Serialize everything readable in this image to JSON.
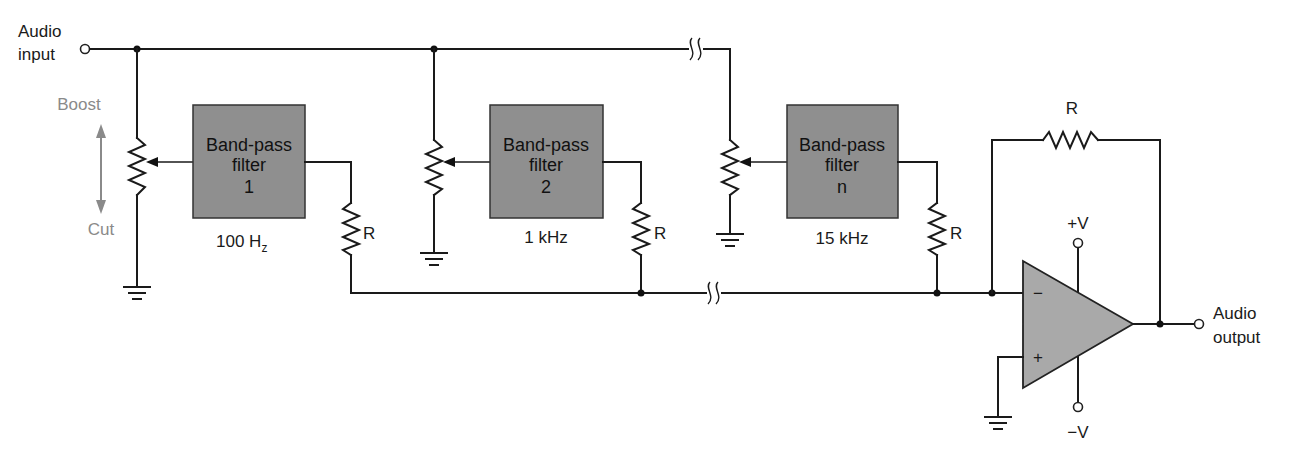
{
  "diagram": {
    "type": "circuit-schematic"
  },
  "terminals": {
    "input": {
      "line1": "Audio",
      "line2": "input"
    },
    "output": {
      "line1": "Audio",
      "line2": "output"
    },
    "supply_pos": "+V",
    "supply_neg": "−V"
  },
  "control": {
    "boost_label": "Boost",
    "cut_label": "Cut"
  },
  "filters": [
    {
      "line1": "Band-pass",
      "line2": "filter",
      "line3": "1",
      "freq": "100 H",
      "freq_sub": "z"
    },
    {
      "line1": "Band-pass",
      "line2": "filter",
      "line3": "2",
      "freq": "1 kHz",
      "freq_sub": ""
    },
    {
      "line1": "Band-pass",
      "line2": "filter",
      "line3": "n",
      "freq": "15 kHz",
      "freq_sub": ""
    }
  ],
  "resistors": {
    "summing_1": "R",
    "summing_2": "R",
    "summing_n": "R",
    "feedback": "R"
  },
  "opamp": {
    "inverting": "−",
    "non_inverting": "+"
  }
}
